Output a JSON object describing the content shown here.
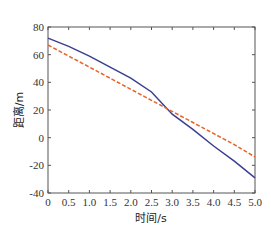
{
  "chart_data": {
    "type": "line",
    "title": "",
    "xlabel": "时间/s",
    "ylabel": "距离/m",
    "xlim": [
      0,
      5.0
    ],
    "ylim": [
      -40,
      80
    ],
    "grid": false,
    "legend": null,
    "x_ticks": [
      "0",
      "0.5",
      "1.0",
      "1.5",
      "2.0",
      "2.5",
      "3.0",
      "3.5",
      "4.0",
      "4.5",
      "5.0"
    ],
    "y_ticks": [
      "80",
      "60",
      "40",
      "20",
      "0",
      "-20",
      "-40"
    ],
    "x": [
      0,
      0.5,
      1.0,
      1.5,
      2.0,
      2.5,
      3.0,
      3.5,
      4.0,
      4.5,
      5.0
    ],
    "series": [
      {
        "name": "solid",
        "style": "solid",
        "color": "#3b3f8f",
        "values": [
          72,
          66,
          59,
          51,
          43,
          33,
          17,
          6,
          -6,
          -17,
          -29
        ]
      },
      {
        "name": "dashed",
        "style": "dashed",
        "color": "#e8632a",
        "values": [
          67,
          59,
          51,
          43,
          35,
          27,
          19,
          11,
          3,
          -5,
          -14
        ]
      }
    ]
  }
}
